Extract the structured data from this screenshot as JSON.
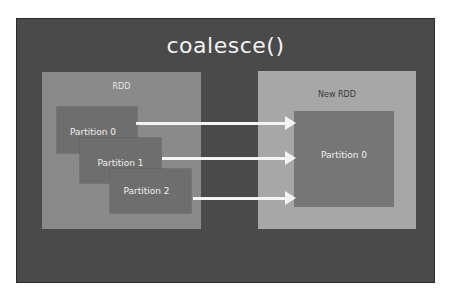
{
  "diagram": {
    "title": "coalesce()",
    "source": {
      "label": "RDD",
      "partitions": [
        "Partition 0",
        "Partition 1",
        "Partition 2"
      ]
    },
    "target": {
      "label": "New RDD",
      "partitions": [
        "Partition 0"
      ]
    },
    "edges": [
      {
        "from": "Partition 0",
        "to": "Partition 0"
      },
      {
        "from": "Partition 1",
        "to": "Partition 0"
      },
      {
        "from": "Partition 2",
        "to": "Partition 0"
      }
    ],
    "colors": {
      "background": "#4a4a4a",
      "source_rdd": "#8a8a8a",
      "target_rdd": "#a7a7a7",
      "partition": "#6e6e6e",
      "arrow": "#f4f4f4",
      "text": "#f2f2f2"
    }
  }
}
